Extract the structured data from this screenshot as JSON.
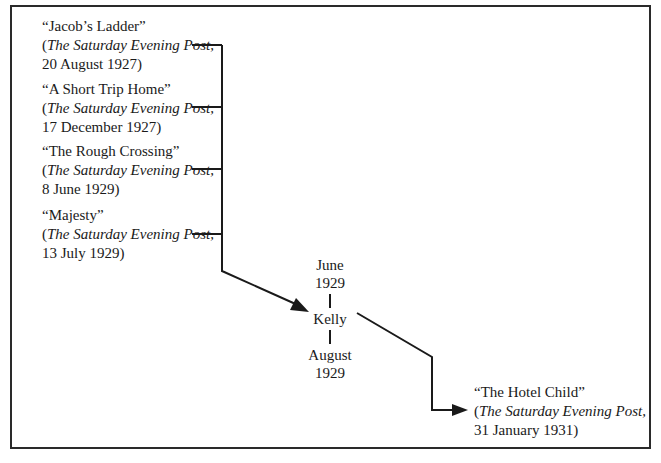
{
  "diagram": {
    "sources": [
      {
        "title": "“Jacob’s Ladder”",
        "open_paren": "(",
        "publication": "The Saturday Evening Post",
        "pub_suffix": ",",
        "date": "20 August 1927)"
      },
      {
        "title": "“A Short Trip Home”",
        "open_paren": "(",
        "publication": "The Saturday Evening Post",
        "pub_suffix": ",",
        "date": "17 December 1927)"
      },
      {
        "title": "“The Rough Crossing”",
        "open_paren": "(",
        "publication": "The Saturday Evening Post",
        "pub_suffix": ",",
        "date": "8 June 1929)"
      },
      {
        "title": "“Majesty”",
        "open_paren": "(",
        "publication": "The Saturday Evening Post",
        "pub_suffix": ",",
        "date": "13 July 1929)"
      }
    ],
    "intermediate": {
      "start_month": "June",
      "start_year": "1929",
      "name": "Kelly",
      "end_month": "August",
      "end_year": "1929"
    },
    "result": {
      "title": "“The Hotel Child”",
      "open_paren": "(",
      "publication": "The Saturday Evening Post",
      "pub_suffix": ",",
      "date": "31 January 1931)"
    },
    "colors": {
      "line": "#1a1a1a",
      "frame": "#2a2a2a",
      "background": "#ffffff"
    }
  }
}
